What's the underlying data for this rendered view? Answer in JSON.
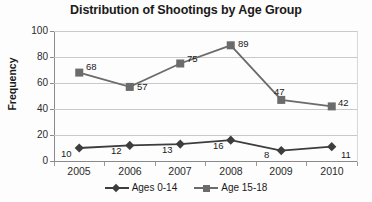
{
  "chart_data": {
    "type": "line",
    "title": "Distribution of Shootings by Age Group",
    "xlabel": "",
    "ylabel": "Frequency",
    "categories": [
      "2005",
      "2006",
      "2007",
      "2008",
      "2009",
      "2010"
    ],
    "ylim": [
      0,
      100
    ],
    "yticks": [
      0,
      20,
      40,
      60,
      80,
      100
    ],
    "grid": "horizontal",
    "legend_position": "bottom",
    "data_labels": true,
    "series": [
      {
        "name": "Ages 0-14",
        "values": [
          10,
          12,
          13,
          16,
          8,
          11
        ],
        "marker": "diamond",
        "color": "#3d3d3d"
      },
      {
        "name": "Age 15-18",
        "values": [
          68,
          57,
          75,
          89,
          47,
          42
        ],
        "marker": "square",
        "color": "#6b6b6b"
      }
    ]
  },
  "axis": {
    "y_tick_labels": [
      "100",
      "80",
      "60",
      "40",
      "20",
      "0"
    ],
    "x_tick_labels": [
      "2005",
      "2006",
      "2007",
      "2008",
      "2009",
      "2010"
    ]
  },
  "labels": {
    "series0": [
      "10",
      "12",
      "13",
      "16",
      "8",
      "11"
    ],
    "series1": [
      "68",
      "57",
      "75",
      "89",
      "47",
      "42"
    ]
  },
  "legend": {
    "entries": [
      {
        "label": "Ages 0-14"
      },
      {
        "label": "Age 15-18"
      }
    ]
  },
  "colors": {
    "series_ages_0_14": "#3d3d3d",
    "series_age_15_18": "#6b6b6b",
    "gridline": "#c9c9c9",
    "axis": "#8a8a8a",
    "text": "#1a1a1a",
    "background": "#fdfdfd"
  }
}
